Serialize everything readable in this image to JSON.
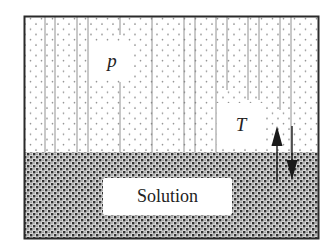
{
  "diagram": {
    "type": "vapor-liquid equilibrium container",
    "regions": {
      "vapor": {
        "label": "p",
        "pattern": "sparse dots with vertical lines"
      },
      "liquid": {
        "label": "Solution",
        "pattern": "dense dark stipple"
      }
    },
    "labels": {
      "pressure": "p",
      "temperature": "T",
      "solution": "Solution"
    },
    "arrows": [
      {
        "direction": "up",
        "meaning": "evaporation"
      },
      {
        "direction": "down",
        "meaning": "condensation"
      }
    ],
    "colors": {
      "frame": "#2a2a2a",
      "dots_light": "#8a8a8a",
      "lines": "#777777",
      "stipple": "#3a3a3a",
      "background": "#ffffff"
    }
  }
}
